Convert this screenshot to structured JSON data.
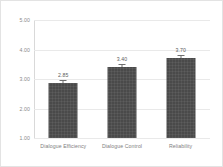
{
  "chart_data": {
    "type": "bar",
    "title": "",
    "xlabel": "",
    "ylabel": "",
    "ylim": [
      1.0,
      5.0
    ],
    "grid": true,
    "legend": false,
    "categories": [
      "Dialogue Efficiency",
      "Dialogue Control",
      "Reliability"
    ],
    "values": [
      2.85,
      3.4,
      3.7
    ],
    "value_labels": [
      "2.85",
      "3.40",
      "3.70"
    ],
    "errors": [
      0.12,
      0.1,
      0.11
    ],
    "y_ticks": [
      1.0,
      2.0,
      3.0,
      4.0,
      5.0
    ],
    "y_tick_labels": [
      "1.00",
      "2.00",
      "3.00",
      "4.00",
      "5.00"
    ],
    "series": [
      {
        "name": "Mean rating",
        "values": [
          2.85,
          3.4,
          3.7
        ]
      }
    ],
    "colors": {
      "bar_fill": "#4a4a4a",
      "gridline": "#e9e9e9",
      "axis": "#d9d9d9",
      "tick_text": "#8a8a8a",
      "value_text": "#5c5c5c",
      "category_text": "#7e7e7e",
      "card_border": "#e3e3e3",
      "background": "#ffffff"
    }
  }
}
